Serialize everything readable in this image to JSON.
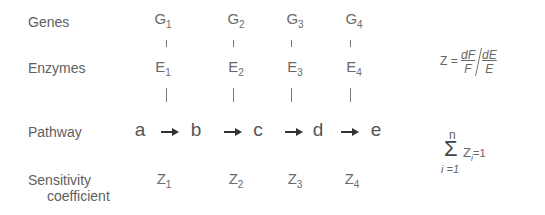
{
  "rows": {
    "genes": "Genes",
    "enzymes": "Enzymes",
    "pathway": "Pathway",
    "sensitivity_line1": "Sensitivity",
    "sensitivity_line2": "coefficient"
  },
  "genes": [
    {
      "base": "G",
      "sub": "1"
    },
    {
      "base": "G",
      "sub": "2"
    },
    {
      "base": "G",
      "sub": "3"
    },
    {
      "base": "G",
      "sub": "4"
    }
  ],
  "enzymes": [
    {
      "base": "E",
      "sub": "1"
    },
    {
      "base": "E",
      "sub": "2"
    },
    {
      "base": "E",
      "sub": "3"
    },
    {
      "base": "E",
      "sub": "4"
    }
  ],
  "pathway": [
    "a",
    "b",
    "c",
    "d",
    "e"
  ],
  "coefficients": [
    {
      "base": "Z",
      "sub": "1"
    },
    {
      "base": "Z",
      "sub": "2"
    },
    {
      "base": "Z",
      "sub": "3"
    },
    {
      "base": "Z",
      "sub": "4"
    }
  ],
  "equation_z": {
    "lhs": "Z =",
    "num1": "dF",
    "den1": "F",
    "num2": "dE",
    "den2": "E"
  },
  "summation": {
    "upper": "n",
    "symbol": "Σ",
    "term": "Z",
    "term_sub": "i",
    "rhs": "=1",
    "lower": "i =1"
  }
}
